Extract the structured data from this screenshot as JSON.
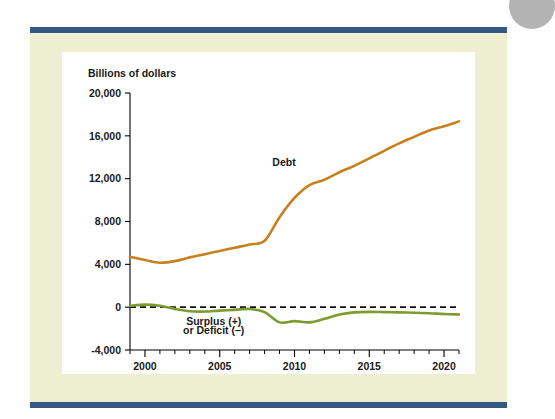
{
  "figure": {
    "accent_rule_color": "#34587f",
    "panel_color": "#eeeed3",
    "plot_background": "#ffffff",
    "corner_disc_color": "#b3b3b3"
  },
  "chart_data": {
    "type": "line",
    "title": "",
    "subtitle": "",
    "xlabel": "",
    "ylabel": "Billions of dollars",
    "xlim": [
      1999,
      2021
    ],
    "ylim": [
      -4000,
      20000
    ],
    "grid": false,
    "legend": "inline-annotations",
    "y_ticks": [
      -4000,
      0,
      4000,
      8000,
      12000,
      16000,
      20000
    ],
    "y_ticklabels": [
      "-4,000",
      "0",
      "4,000",
      "8,000",
      "12,000",
      "16,000",
      "20,000"
    ],
    "x_ticks": [
      2000,
      2005,
      2010,
      2015,
      2020
    ],
    "x_ticklabels": [
      "2000",
      "2005",
      "2010",
      "2015",
      "2020"
    ],
    "x_minor_ticks": [
      1999,
      2001,
      2002,
      2003,
      2004,
      2006,
      2007,
      2008,
      2009,
      2011,
      2012,
      2013,
      2014,
      2016,
      2017,
      2018,
      2019,
      2021
    ],
    "reference_line": {
      "value": 0,
      "style": "dashed",
      "color": "#111111"
    },
    "annotations": [
      {
        "text": "Debt",
        "x": 2009.3,
        "y": 13200
      },
      {
        "text": "Surplus (+)",
        "x": 2004.6,
        "y": -1700
      },
      {
        "text": "or Deficit (–)",
        "x": 2004.6,
        "y": -2550
      }
    ],
    "x": [
      1999,
      2000,
      2001,
      2002,
      2003,
      2004,
      2005,
      2006,
      2007,
      2008,
      2009,
      2010,
      2011,
      2012,
      2013,
      2014,
      2015,
      2016,
      2017,
      2018,
      2019,
      2020,
      2021
    ],
    "series": [
      {
        "name": "Debt",
        "color": "#c8801e",
        "values": [
          4700,
          4400,
          4150,
          4300,
          4650,
          4950,
          5250,
          5550,
          5850,
          6200,
          8400,
          10200,
          11400,
          11900,
          12600,
          13200,
          13900,
          14600,
          15300,
          15900,
          16500,
          16900,
          17350
        ]
      },
      {
        "name": "Surplus (+) or Deficit (–)",
        "color": "#7d9b2f",
        "values": [
          120,
          240,
          130,
          -160,
          -380,
          -410,
          -320,
          -250,
          -170,
          -460,
          -1420,
          -1300,
          -1420,
          -1090,
          -680,
          -490,
          -440,
          -460,
          -490,
          -520,
          -570,
          -640,
          -680
        ]
      }
    ]
  }
}
